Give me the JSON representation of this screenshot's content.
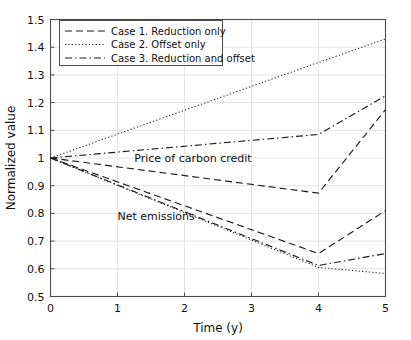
{
  "chart_data": {
    "type": "line",
    "title": "",
    "xlabel": "Time (y)",
    "ylabel": "Normalized value",
    "xlim": [
      0,
      5
    ],
    "ylim": [
      0.5,
      1.5
    ],
    "xticks": [
      "0",
      "1",
      "2",
      "3",
      "4",
      "5"
    ],
    "yticks": [
      "0.5",
      "0.6",
      "0.7",
      "0.8",
      "0.9",
      "1",
      "1.1",
      "1.2",
      "1.3",
      "1.4",
      "1.5"
    ],
    "grid": true,
    "legend_position": "upper-left",
    "legend": [
      {
        "label": "Case 1. Reduction only",
        "style": "dashed"
      },
      {
        "label": "Case 2. Offset only",
        "style": "dotted"
      },
      {
        "label": "Case 3. Reduction and offset",
        "style": "dashdot"
      }
    ],
    "annotations": [
      {
        "text": "Price of carbon credit",
        "x": 1.25,
        "y": 1.0
      },
      {
        "text": "Net emissions",
        "x": 1.0,
        "y": 0.79
      }
    ],
    "x": [
      0,
      4,
      5
    ],
    "series": [
      {
        "name": "Case 2. Offset only — Price of carbon credit",
        "group": "Price of carbon credit",
        "style": "dotted",
        "x": [
          0,
          4,
          5
        ],
        "values": [
          1.0,
          1.345,
          1.43
        ]
      },
      {
        "name": "Case 3. Reduction and offset — Price of carbon credit",
        "group": "Price of carbon credit",
        "style": "dashdot",
        "x": [
          0,
          4,
          5
        ],
        "values": [
          1.0,
          1.085,
          1.225
        ]
      },
      {
        "name": "Case 1. Reduction only — Price of carbon credit",
        "group": "Price of carbon credit",
        "style": "dashed",
        "x": [
          0,
          4,
          5
        ],
        "values": [
          1.0,
          0.873,
          1.175
        ]
      },
      {
        "name": "Case 1. Reduction only — Net emissions",
        "group": "Net emissions",
        "style": "dashed",
        "x": [
          0,
          4,
          5
        ],
        "values": [
          1.0,
          0.655,
          0.81
        ]
      },
      {
        "name": "Case 3. Reduction and offset — Net emissions",
        "group": "Net emissions",
        "style": "dashdot",
        "x": [
          0,
          4,
          5
        ],
        "values": [
          1.0,
          0.612,
          0.655
        ]
      },
      {
        "name": "Case 2. Offset only — Net emissions",
        "group": "Net emissions",
        "style": "dotted",
        "x": [
          0,
          4,
          5
        ],
        "values": [
          1.0,
          0.605,
          0.583
        ]
      }
    ]
  },
  "colors": {
    "line": "#1c1c1c",
    "grid": "#d8d8d8",
    "frame": "#4a4a4a",
    "background": "#ffffff"
  }
}
